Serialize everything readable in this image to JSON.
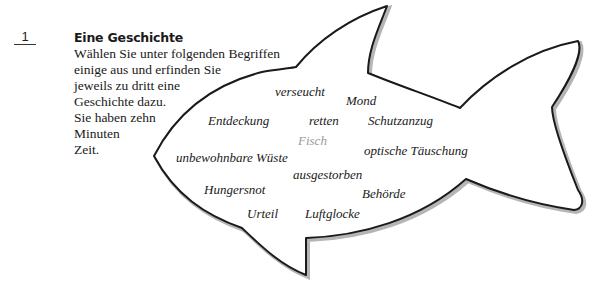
{
  "exercise": {
    "number": "1",
    "title": "Eine Geschichte",
    "instruction_lines": [
      "Wählen Sie unter folgenden Begriffen",
      "einige aus und erfinden Sie",
      "jeweils zu dritt eine",
      "Geschichte dazu.",
      "Sie haben zehn",
      "Minuten",
      "Zeit."
    ]
  },
  "fish": {
    "center_word": "Fisch",
    "words": [
      "verseucht",
      "Mond",
      "Entdeckung",
      "retten",
      "Schutzanzug",
      "unbewohnbare Wüste",
      "optische Täuschung",
      "ausgestorben",
      "Hungersnot",
      "Behörde",
      "Urteil",
      "Luftglocke"
    ]
  },
  "colors": {
    "outline": "#1a1a1a",
    "shadow": "#b5b5b5",
    "center_word": "#9a9a9a",
    "text": "#1a1a1a"
  }
}
